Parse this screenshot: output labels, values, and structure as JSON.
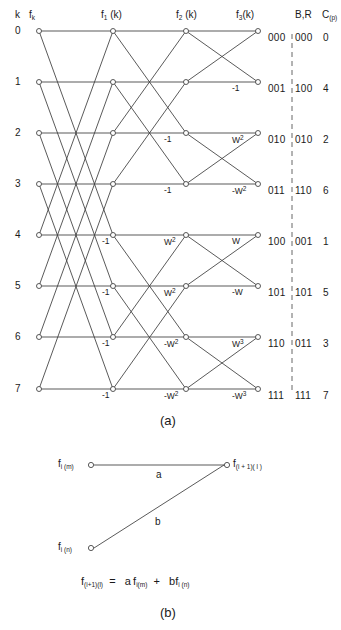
{
  "figure": {
    "panel_a_caption": "(a)",
    "panel_b_caption": "(b)",
    "axis_header_k": "k",
    "column_headers": [
      {
        "base": "f",
        "sub": "k",
        "tail": ""
      },
      {
        "base": "f",
        "sub": "1",
        "tail": " (k)"
      },
      {
        "base": "f",
        "sub": "2",
        "tail": " (k)"
      },
      {
        "base": "f",
        "sub": "3",
        "tail": "(k)"
      }
    ],
    "br_header": "B,R",
    "cp_header_base": "C",
    "cp_header_sub": "(p)",
    "row_indices": [
      "0",
      "1",
      "2",
      "3",
      "4",
      "5",
      "6",
      "7"
    ],
    "rows": [
      {
        "k": "0",
        "B": "000",
        "R": "000",
        "C": "0"
      },
      {
        "k": "1",
        "B": "001",
        "R": "100",
        "C": "4"
      },
      {
        "k": "2",
        "B": "010",
        "R": "010",
        "C": "2"
      },
      {
        "k": "3",
        "B": "011",
        "R": "110",
        "C": "6"
      },
      {
        "k": "4",
        "B": "100",
        "R": "001",
        "C": "1"
      },
      {
        "k": "5",
        "B": "101",
        "R": "101",
        "C": "5"
      },
      {
        "k": "6",
        "B": "110",
        "R": "011",
        "C": "3"
      },
      {
        "k": "7",
        "B": "111",
        "R": "111",
        "C": "7"
      }
    ],
    "stage1_weights": [
      {
        "row": 4,
        "text": "-1"
      },
      {
        "row": 5,
        "text": "-1"
      },
      {
        "row": 6,
        "text": "-1"
      },
      {
        "row": 7,
        "text": "-1"
      }
    ],
    "stage2_weights": [
      {
        "row": 2,
        "base": "-1",
        "sup": ""
      },
      {
        "row": 3,
        "base": "-1",
        "sup": ""
      },
      {
        "row": 4,
        "base": "W",
        "sup": "2"
      },
      {
        "row": 5,
        "base": "W",
        "sup": "2"
      },
      {
        "row": 6,
        "base": "-W",
        "sup": "2"
      },
      {
        "row": 7,
        "base": "-W",
        "sup": "2"
      }
    ],
    "stage3_weights": [
      {
        "row": 1,
        "base": "-1",
        "sup": ""
      },
      {
        "row": 2,
        "base": "W",
        "sup": "2"
      },
      {
        "row": 3,
        "base": "-W",
        "sup": "2"
      },
      {
        "row": 4,
        "base": "W",
        "sup": ""
      },
      {
        "row": 5,
        "base": "-W",
        "sup": ""
      },
      {
        "row": 6,
        "base": "W",
        "sup": "3"
      },
      {
        "row": 7,
        "base": "-W",
        "sup": "3"
      }
    ],
    "panel_b": {
      "node_top_left_base": "f",
      "node_top_left_sub": "i (m)",
      "node_bottom_left_base": "f",
      "node_bottom_left_sub": "i (n)",
      "node_right_base": "f",
      "node_right_sub": "(i + 1)( l )",
      "edge_a_label": "a",
      "edge_b_label": "b",
      "equation": "f(i+1)(l)  =   a f i(m)  +   b f i(n)",
      "equation_parts": {
        "lhs_base": "f",
        "lhs_sub": "(i+1)(l)",
        "eq": "=",
        "coef_a": "a",
        "term1_base": "f",
        "term1_sub": "i(m)",
        "plus": "+",
        "coef_b": "b",
        "term2_base": "f",
        "term2_sub": "i (n)"
      }
    },
    "colors": {
      "line": "#3c3c3c",
      "dashed": "#666666",
      "text": "#1a1a1a",
      "background": "#ffffff"
    }
  }
}
